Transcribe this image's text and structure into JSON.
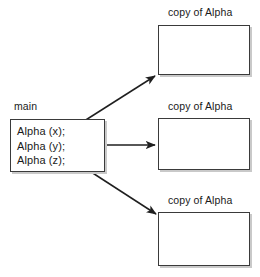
{
  "diagram": {
    "caller": {
      "label": "main",
      "code_lines": [
        "Alpha (x);",
        "Alpha (y);",
        "Alpha (z);"
      ]
    },
    "copies": [
      {
        "label": "copy of Alpha"
      },
      {
        "label": "copy of Alpha"
      },
      {
        "label": "copy of Alpha"
      }
    ],
    "arrows": [
      {
        "name": "arrow-to-copy-1",
        "from": "Alpha (x);",
        "to": "copy of Alpha"
      },
      {
        "name": "arrow-to-copy-2",
        "from": "Alpha (y);",
        "to": "copy of Alpha"
      },
      {
        "name": "arrow-to-copy-3",
        "from": "Alpha (z);",
        "to": "copy of Alpha"
      }
    ],
    "colors": {
      "background": "#ffffff",
      "box_border": "#3a3a3a",
      "box_fill": "#ffffff",
      "box_shadow": "#c9c9c9",
      "arrow": "#1f1f1f",
      "text": "#1a1a1a"
    }
  }
}
